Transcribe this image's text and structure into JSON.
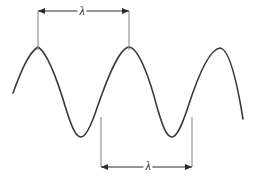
{
  "figure": {
    "background_color": "#ffffff",
    "width": 257,
    "height": 184
  },
  "wave": {
    "name": "sinusoidal-wave",
    "stroke_color": "#3a3a3a",
    "stroke_width": 1.6,
    "start_point": {
      "x": 13,
      "y": 93
    },
    "end_point": {
      "x": 243,
      "y": 119
    },
    "crest_y": 47,
    "trough_y": 137,
    "crests_x": [
      38,
      129,
      220
    ],
    "troughs_x": [
      81,
      172
    ],
    "path": "M 13,93 C 20,74 28,53 38,47 C 48,53 58,82 66,109 C 72,128 76,137 81,137 C 86,137 91,126 97,108 C 107,79 119,48 129,47 C 139,48 150,80 157,107 C 163,128 167,137 172,137 C 177,137 182,125 188,107 C 198,76 210,49 220,48 C 230,49 238,88 243,119"
  },
  "measurements": [
    {
      "id": "top-wavelength",
      "name": "wavelength-measurement-top",
      "label": "λ",
      "description": "crest to crest",
      "x_start": 38,
      "x_end": 129,
      "arrow_y": 11,
      "extension_top_y": 11,
      "extension_bottom_y": 50,
      "label_x": 82,
      "label_y": 11
    },
    {
      "id": "bottom-wavelength",
      "name": "wavelength-measurement-bottom",
      "label": "λ",
      "description": "trough to trough",
      "x_start": 101,
      "x_end": 192,
      "arrow_y": 167,
      "extension_top_y": 117,
      "extension_bottom_y": 167,
      "label_x": 148,
      "label_y": 166
    }
  ],
  "colors": {
    "wave_stroke": "#3a3a3a",
    "extension_line": "#8c8c8c",
    "dimension_line": "#2b2b2b",
    "label_text": "#1a1a1a",
    "background": "#ffffff"
  }
}
